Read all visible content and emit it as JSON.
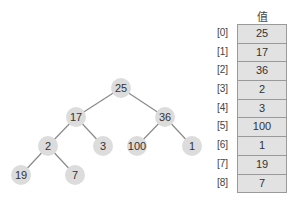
{
  "tree": {
    "edge_color": "#8a8a8a",
    "node_fill": "#dcdcdc",
    "node_radius": 10,
    "nodes": [
      {
        "index": 0,
        "value": "25",
        "x": 121,
        "y": 88
      },
      {
        "index": 1,
        "value": "17",
        "x": 76,
        "y": 117
      },
      {
        "index": 2,
        "value": "36",
        "x": 165,
        "y": 117
      },
      {
        "index": 3,
        "value": "2",
        "x": 48,
        "y": 146
      },
      {
        "index": 4,
        "value": "3",
        "x": 103,
        "y": 146
      },
      {
        "index": 5,
        "value": "100",
        "x": 137,
        "y": 146
      },
      {
        "index": 6,
        "value": "1",
        "x": 192,
        "y": 146
      },
      {
        "index": 7,
        "value": "19",
        "x": 21,
        "y": 175
      },
      {
        "index": 8,
        "value": "7",
        "x": 75,
        "y": 175
      }
    ],
    "edges": [
      [
        0,
        1
      ],
      [
        0,
        2
      ],
      [
        1,
        3
      ],
      [
        1,
        4
      ],
      [
        2,
        5
      ],
      [
        2,
        6
      ],
      [
        3,
        7
      ],
      [
        3,
        8
      ]
    ]
  },
  "array": {
    "header": "值",
    "rows": [
      {
        "index": "[0]",
        "value": "25"
      },
      {
        "index": "[1]",
        "value": "17"
      },
      {
        "index": "[2]",
        "value": "36"
      },
      {
        "index": "[3]",
        "value": "2"
      },
      {
        "index": "[4]",
        "value": "3"
      },
      {
        "index": "[5]",
        "value": "100"
      },
      {
        "index": "[6]",
        "value": "1"
      },
      {
        "index": "[7]",
        "value": "19"
      },
      {
        "index": "[8]",
        "value": "7"
      }
    ]
  }
}
